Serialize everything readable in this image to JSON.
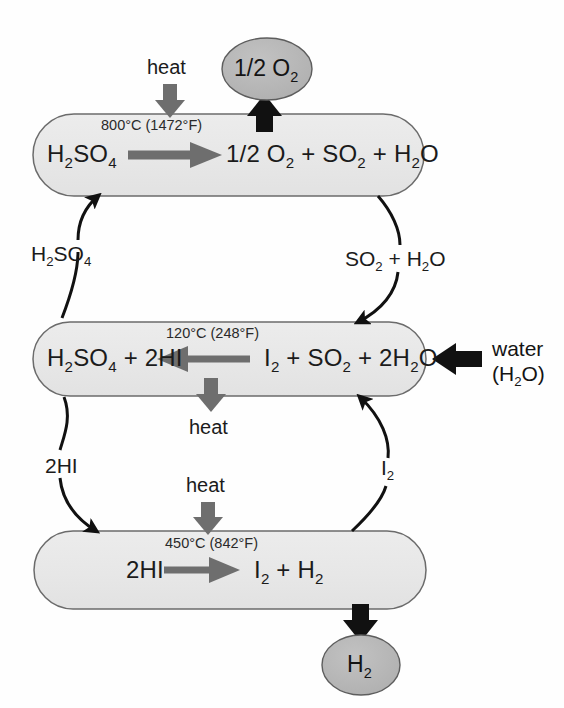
{
  "diagram": {
    "background_color": "#fefefe",
    "stage_fill": "#e8e8e8",
    "stage_stroke": "#5a5a5a",
    "bubble_fill": "#b4b4b4",
    "bubble_stroke": "#4a4a4a",
    "gray_arrow_color": "#707070",
    "black_arrow_color": "#111111"
  },
  "stages": [
    {
      "id": "stage-sulfuric-acid-decomposition",
      "temperature": "800°C (1472°F)",
      "reactant": "H2SO4",
      "reactant_html": "H<sub>2</sub>SO<sub>4</sub>",
      "product": "1/2 O2 + SO2 + H2O",
      "product_html": "1/2 O<sub>2</sub> + SO<sub>2</sub> + H<sub>2</sub>O",
      "arrow_direction": "right",
      "heat_label": "heat",
      "heat_direction": "in"
    },
    {
      "id": "stage-bunsen-reaction",
      "temperature": "120°C (248°F)",
      "reactant": "I2 + SO2 + 2H2O",
      "reactant_html": "I<sub>2</sub> + SO<sub>2</sub> + 2H<sub>2</sub>O",
      "product": "H2SO4 + 2HI",
      "product_html": "H<sub>2</sub>SO<sub>4</sub> + 2HI",
      "arrow_direction": "left",
      "heat_label": "heat",
      "heat_direction": "out"
    },
    {
      "id": "stage-hydrogen-iodide-decomposition",
      "temperature": "450°C (842°F)",
      "reactant": "2HI",
      "reactant_html": "2HI",
      "product": "I2 + H2",
      "product_html": "I<sub>2</sub> + H<sub>2</sub>",
      "arrow_direction": "right",
      "heat_label": "heat",
      "heat_direction": "in"
    }
  ],
  "bubbles": [
    {
      "id": "output-oxygen",
      "label": "1/2 O2",
      "label_html": "1/2 O<sub>2</sub>"
    },
    {
      "id": "output-hydrogen",
      "label": "H2",
      "label_html": "H<sub>2</sub>"
    }
  ],
  "recycle_labels": [
    {
      "id": "recycle-sulfuric-acid",
      "label": "H2SO4",
      "label_html": "H<sub>2</sub>SO<sub>4</sub>",
      "flow": "stage-bunsen-reaction → stage-sulfuric-acid-decomposition"
    },
    {
      "id": "recycle-sulfur-dioxide-water",
      "label": "SO2 + H2O",
      "label_html": "SO<sub>2</sub> + H<sub>2</sub>O",
      "flow": "stage-sulfuric-acid-decomposition → stage-bunsen-reaction"
    },
    {
      "id": "recycle-hydrogen-iodide",
      "label": "2HI",
      "label_html": "2HI",
      "flow": "stage-bunsen-reaction → stage-hydrogen-iodide-decomposition"
    },
    {
      "id": "recycle-iodine",
      "label": "I2",
      "label_html": "I<sub>2</sub>",
      "flow": "stage-hydrogen-iodide-decomposition → stage-bunsen-reaction"
    }
  ],
  "feed": {
    "id": "feed-water",
    "line1": "water",
    "line2": "(H2O)",
    "line2_html": "(H<sub>2</sub>O)"
  }
}
